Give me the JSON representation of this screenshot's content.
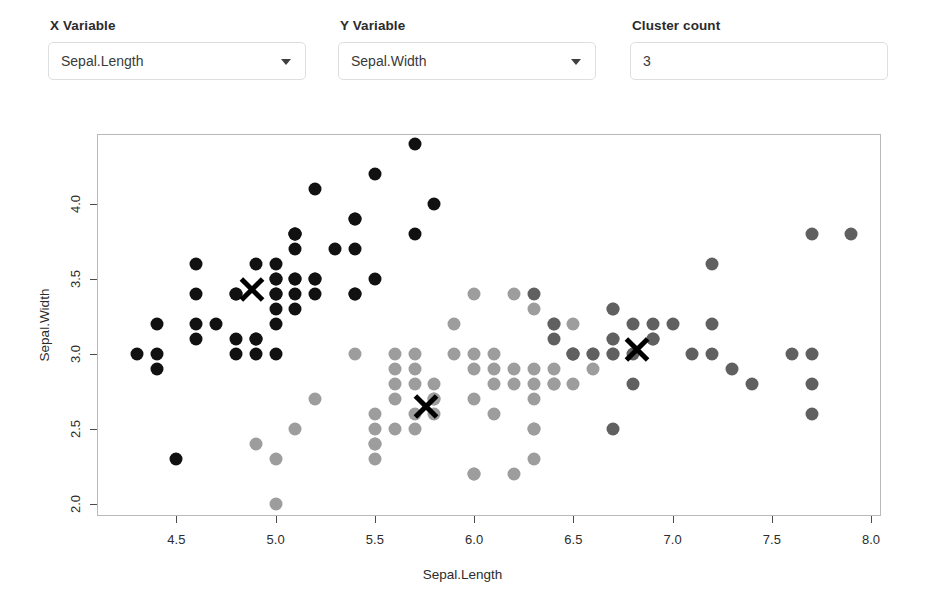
{
  "controls": {
    "x_variable": {
      "label": "X Variable",
      "value": "Sepal.Length",
      "caret_icon": "chevron-down-icon"
    },
    "y_variable": {
      "label": "Y Variable",
      "value": "Sepal.Width",
      "caret_icon": "chevron-down-icon"
    },
    "cluster_count": {
      "label": "Cluster count",
      "value": "3"
    }
  },
  "chart_data": {
    "type": "scatter",
    "title": "",
    "xlabel": "Sepal.Length",
    "ylabel": "Sepal.Width",
    "xlim": [
      4.1,
      8.05
    ],
    "ylim": [
      1.92,
      4.47
    ],
    "xticks": [
      4.5,
      5.0,
      5.5,
      6.0,
      6.5,
      7.0,
      7.5,
      8.0
    ],
    "xtick_labels": [
      "4.5",
      "5.0",
      "5.5",
      "6.0",
      "6.5",
      "7.0",
      "7.5",
      "8.0"
    ],
    "yticks": [
      2.0,
      2.5,
      3.0,
      3.5,
      4.0
    ],
    "ytick_labels": [
      "2.0",
      "2.5",
      "3.0",
      "3.5",
      "4.0"
    ],
    "grid": false,
    "legend": "none",
    "marker": "filled-circle",
    "marker_size": 13,
    "colors": {
      "cluster1": "#111111",
      "cluster2": "#9d9d9d",
      "cluster3": "#606060",
      "centroid": "#000000",
      "frame": "#b9b9b9",
      "axis": "#4a4a4a"
    },
    "series": [
      {
        "name": "cluster1",
        "color": "#111111",
        "points": [
          [
            4.3,
            3.0
          ],
          [
            4.4,
            3.2
          ],
          [
            4.4,
            3.0
          ],
          [
            4.4,
            2.9
          ],
          [
            4.5,
            2.3
          ],
          [
            4.6,
            3.1
          ],
          [
            4.6,
            3.4
          ],
          [
            4.6,
            3.6
          ],
          [
            4.6,
            3.2
          ],
          [
            4.7,
            3.2
          ],
          [
            4.8,
            3.4
          ],
          [
            4.8,
            3.0
          ],
          [
            4.8,
            3.4
          ],
          [
            4.8,
            3.1
          ],
          [
            4.9,
            3.1
          ],
          [
            4.9,
            3.6
          ],
          [
            4.9,
            3.1
          ],
          [
            4.9,
            3.0
          ],
          [
            5.0,
            3.6
          ],
          [
            5.0,
            3.4
          ],
          [
            5.0,
            3.0
          ],
          [
            5.0,
            3.4
          ],
          [
            5.0,
            3.5
          ],
          [
            5.0,
            3.2
          ],
          [
            5.0,
            3.3
          ],
          [
            5.0,
            3.5
          ],
          [
            5.1,
            3.5
          ],
          [
            5.1,
            3.5
          ],
          [
            5.1,
            3.8
          ],
          [
            5.1,
            3.7
          ],
          [
            5.1,
            3.3
          ],
          [
            5.1,
            3.4
          ],
          [
            5.1,
            3.8
          ],
          [
            5.1,
            3.8
          ],
          [
            5.2,
            3.5
          ],
          [
            5.2,
            3.4
          ],
          [
            5.2,
            4.1
          ],
          [
            5.2,
            3.5
          ],
          [
            5.3,
            3.7
          ],
          [
            5.4,
            3.9
          ],
          [
            5.4,
            3.7
          ],
          [
            5.4,
            3.9
          ],
          [
            5.4,
            3.4
          ],
          [
            5.4,
            3.4
          ],
          [
            5.5,
            4.2
          ],
          [
            5.5,
            3.5
          ],
          [
            5.7,
            4.4
          ],
          [
            5.7,
            3.8
          ],
          [
            5.8,
            4.0
          ]
        ]
      },
      {
        "name": "cluster2",
        "color": "#9d9d9d",
        "points": [
          [
            4.9,
            2.4
          ],
          [
            5.0,
            2.0
          ],
          [
            5.0,
            2.3
          ],
          [
            5.1,
            2.5
          ],
          [
            5.2,
            2.7
          ],
          [
            5.4,
            3.0
          ],
          [
            5.5,
            2.4
          ],
          [
            5.5,
            2.4
          ],
          [
            5.5,
            2.3
          ],
          [
            5.5,
            2.6
          ],
          [
            5.5,
            2.5
          ],
          [
            5.6,
            2.9
          ],
          [
            5.6,
            3.0
          ],
          [
            5.6,
            2.5
          ],
          [
            5.6,
            2.7
          ],
          [
            5.6,
            2.8
          ],
          [
            5.7,
            2.8
          ],
          [
            5.7,
            3.0
          ],
          [
            5.7,
            2.9
          ],
          [
            5.7,
            2.6
          ],
          [
            5.7,
            2.5
          ],
          [
            5.8,
            2.7
          ],
          [
            5.8,
            2.7
          ],
          [
            5.8,
            2.6
          ],
          [
            5.8,
            2.8
          ],
          [
            5.9,
            3.0
          ],
          [
            5.9,
            3.2
          ],
          [
            6.0,
            2.2
          ],
          [
            6.0,
            2.9
          ],
          [
            6.0,
            2.7
          ],
          [
            6.0,
            3.4
          ],
          [
            6.0,
            2.2
          ],
          [
            6.0,
            3.0
          ],
          [
            6.1,
            2.9
          ],
          [
            6.1,
            2.8
          ],
          [
            6.1,
            3.0
          ],
          [
            6.1,
            2.6
          ],
          [
            6.2,
            2.2
          ],
          [
            6.2,
            2.9
          ],
          [
            6.2,
            2.8
          ],
          [
            6.2,
            3.4
          ],
          [
            6.3,
            2.3
          ],
          [
            6.3,
            2.5
          ],
          [
            6.3,
            2.8
          ],
          [
            6.3,
            2.9
          ],
          [
            6.3,
            3.3
          ],
          [
            6.3,
            2.7
          ],
          [
            6.3,
            2.5
          ],
          [
            6.4,
            2.9
          ],
          [
            6.4,
            3.2
          ],
          [
            6.4,
            2.8
          ],
          [
            6.4,
            2.8
          ],
          [
            6.5,
            2.8
          ],
          [
            6.5,
            3.0
          ],
          [
            6.5,
            3.2
          ],
          [
            6.6,
            2.9
          ],
          [
            6.6,
            3.0
          ],
          [
            6.7,
            3.1
          ],
          [
            6.7,
            3.0
          ],
          [
            6.7,
            3.3
          ]
        ]
      },
      {
        "name": "cluster3",
        "color": "#606060",
        "points": [
          [
            6.4,
            3.2
          ],
          [
            6.5,
            3.0
          ],
          [
            6.7,
            2.5
          ],
          [
            6.7,
            3.1
          ],
          [
            6.7,
            3.0
          ],
          [
            6.7,
            3.3
          ],
          [
            6.8,
            2.8
          ],
          [
            6.8,
            3.0
          ],
          [
            6.8,
            3.2
          ],
          [
            6.9,
            3.1
          ],
          [
            6.9,
            3.2
          ],
          [
            6.9,
            3.1
          ],
          [
            7.0,
            3.2
          ],
          [
            7.1,
            3.0
          ],
          [
            7.2,
            3.6
          ],
          [
            7.2,
            3.2
          ],
          [
            7.2,
            3.0
          ],
          [
            7.3,
            2.9
          ],
          [
            7.4,
            2.8
          ],
          [
            7.6,
            3.0
          ],
          [
            7.7,
            3.8
          ],
          [
            7.7,
            2.6
          ],
          [
            7.7,
            2.8
          ],
          [
            7.7,
            3.0
          ],
          [
            7.9,
            3.8
          ],
          [
            6.3,
            3.4
          ],
          [
            6.4,
            3.1
          ],
          [
            6.5,
            3.0
          ],
          [
            6.6,
            3.0
          ]
        ]
      }
    ],
    "centroids": [
      {
        "label": "centroid-cluster1",
        "x": 4.88,
        "y": 3.43
      },
      {
        "label": "centroid-cluster2",
        "x": 5.76,
        "y": 2.65
      },
      {
        "label": "centroid-cluster3",
        "x": 6.82,
        "y": 3.03
      }
    ]
  }
}
